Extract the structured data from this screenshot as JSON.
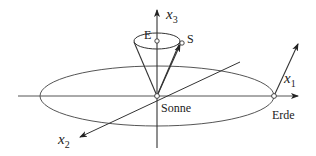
{
  "diagram": {
    "labels": {
      "x1": "x",
      "x1_sub": "1",
      "x2": "x",
      "x2_sub": "2",
      "x3": "x",
      "x3_sub": "3",
      "sun": "Sonne",
      "earth": "Erde",
      "point_e": "E",
      "point_s": "S"
    },
    "colors": {
      "line": "#333333",
      "orbit": "#555555"
    }
  }
}
